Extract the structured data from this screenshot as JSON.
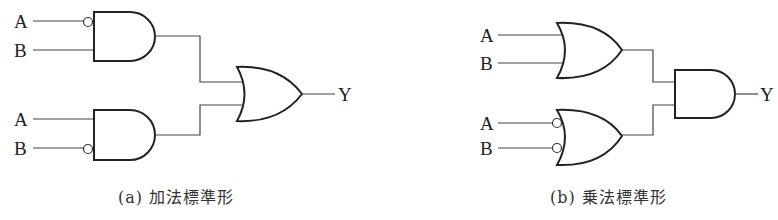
{
  "diagram_a": {
    "caption": "(a) 加法標準形",
    "gate1": {
      "type": "AND",
      "inputs": [
        {
          "label": "A",
          "inverted": true
        },
        {
          "label": "B",
          "inverted": false
        }
      ]
    },
    "gate2": {
      "type": "AND",
      "inputs": [
        {
          "label": "A",
          "inverted": false
        },
        {
          "label": "B",
          "inverted": true
        }
      ]
    },
    "output_gate": {
      "type": "OR"
    },
    "output_label": "Y",
    "labels": {
      "g1_a": "A",
      "g1_b": "B",
      "g2_a": "A",
      "g2_b": "B",
      "y": "Y"
    }
  },
  "diagram_b": {
    "caption": "(b) 乗法標準形",
    "gate1": {
      "type": "OR",
      "inputs": [
        {
          "label": "A",
          "inverted": false
        },
        {
          "label": "B",
          "inverted": false
        }
      ]
    },
    "gate2": {
      "type": "OR",
      "inputs": [
        {
          "label": "A",
          "inverted": true
        },
        {
          "label": "B",
          "inverted": true
        }
      ]
    },
    "output_gate": {
      "type": "AND"
    },
    "output_label": "Y",
    "labels": {
      "g1_a": "A",
      "g1_b": "B",
      "g2_a": "A",
      "g2_b": "B",
      "y": "Y"
    }
  }
}
